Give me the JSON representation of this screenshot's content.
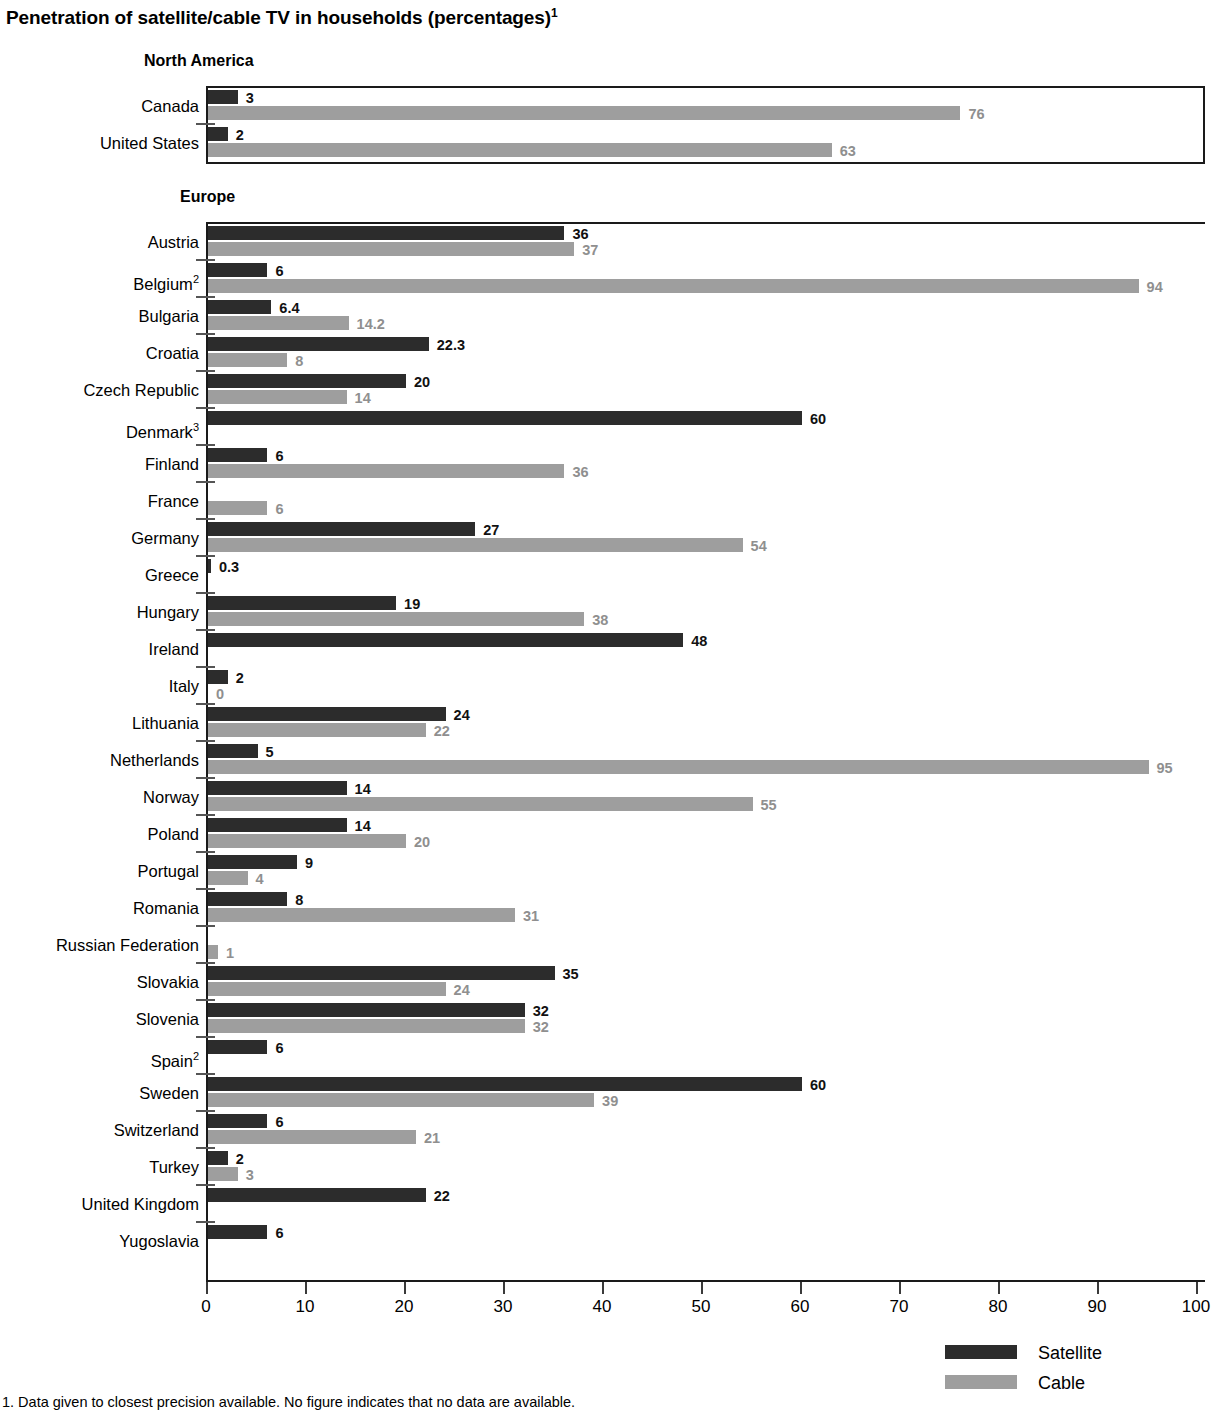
{
  "title": {
    "text": "Penetration of satellite/cable TV in households (percentages)",
    "footnote_marker": "1"
  },
  "legend": {
    "items": [
      {
        "label": "Satellite",
        "color": "#2c2c2c",
        "key": "satellite"
      },
      {
        "label": "Cable",
        "color": "#9e9e9e",
        "key": "cable"
      }
    ]
  },
  "axis": {
    "ticks": [
      "0",
      "10",
      "20",
      "30",
      "40",
      "50",
      "60",
      "70",
      "80",
      "90",
      "100"
    ],
    "min": 0,
    "max": 100
  },
  "footnotes": [
    "1. Data given to closest precision available. No figure indicates that no data are available."
  ],
  "chart_data": {
    "type": "bar",
    "orientation": "horizontal",
    "title": "Penetration of satellite/cable TV in households (percentages)",
    "xlabel": "",
    "ylabel": "",
    "xlim": [
      0,
      100
    ],
    "grid": false,
    "legend_position": "bottom-right",
    "series": [
      {
        "name": "Satellite",
        "color": "#2c2c2c"
      },
      {
        "name": "Cable",
        "color": "#9e9e9e"
      }
    ],
    "groups": [
      {
        "name": "North America",
        "rows": [
          {
            "label": "Canada",
            "satellite": 3,
            "satellite_text": "3",
            "cable": 76,
            "cable_text": "76"
          },
          {
            "label": "United States",
            "satellite": 2,
            "satellite_text": "2",
            "cable": 63,
            "cable_text": "63"
          }
        ]
      },
      {
        "name": "Europe",
        "rows": [
          {
            "label": "Austria",
            "satellite": 36,
            "satellite_text": "36",
            "cable": 37,
            "cable_text": "37"
          },
          {
            "label": "Belgium",
            "sup": "2",
            "satellite": 6,
            "satellite_text": "6",
            "cable": 94,
            "cable_text": "94"
          },
          {
            "label": "Bulgaria",
            "satellite": 6.4,
            "satellite_text": "6.4",
            "cable": 14.2,
            "cable_text": "14.2"
          },
          {
            "label": "Croatia",
            "satellite": 22.3,
            "satellite_text": "22.3",
            "cable": 8,
            "cable_text": "8"
          },
          {
            "label": "Czech Republic",
            "satellite": 20,
            "satellite_text": "20",
            "cable": 14,
            "cable_text": "14"
          },
          {
            "label": "Denmark",
            "sup": "3",
            "satellite": 60,
            "satellite_text": "60",
            "cable": null,
            "cable_text": ""
          },
          {
            "label": "Finland",
            "satellite": 6,
            "satellite_text": "6",
            "cable": 36,
            "cable_text": "36"
          },
          {
            "label": "France",
            "satellite": null,
            "satellite_text": "",
            "cable": 6,
            "cable_text": "6"
          },
          {
            "label": "Germany",
            "satellite": 27,
            "satellite_text": "27",
            "cable": 54,
            "cable_text": "54"
          },
          {
            "label": "Greece",
            "satellite": 0.3,
            "satellite_text": "0.3",
            "cable": null,
            "cable_text": ""
          },
          {
            "label": "Hungary",
            "satellite": 19,
            "satellite_text": "19",
            "cable": 38,
            "cable_text": "38"
          },
          {
            "label": "Ireland",
            "satellite": 48,
            "satellite_text": "48",
            "cable": null,
            "cable_text": ""
          },
          {
            "label": "Italy",
            "satellite": 2,
            "satellite_text": "2",
            "cable": 0,
            "cable_text": "0"
          },
          {
            "label": "Lithuania",
            "satellite": 24,
            "satellite_text": "24",
            "cable": 22,
            "cable_text": "22"
          },
          {
            "label": "Netherlands",
            "satellite": 5,
            "satellite_text": "5",
            "cable": 95,
            "cable_text": "95"
          },
          {
            "label": "Norway",
            "satellite": 14,
            "satellite_text": "14",
            "cable": 55,
            "cable_text": "55"
          },
          {
            "label": "Poland",
            "satellite": 14,
            "satellite_text": "14",
            "cable": 20,
            "cable_text": "20"
          },
          {
            "label": "Portugal",
            "satellite": 9,
            "satellite_text": "9",
            "cable": 4,
            "cable_text": "4"
          },
          {
            "label": "Romania",
            "satellite": 8,
            "satellite_text": "8",
            "cable": 31,
            "cable_text": "31"
          },
          {
            "label": "Russian Federation",
            "satellite": null,
            "satellite_text": "",
            "cable": 1,
            "cable_text": "1"
          },
          {
            "label": "Slovakia",
            "satellite": 35,
            "satellite_text": "35",
            "cable": 24,
            "cable_text": "24"
          },
          {
            "label": "Slovenia",
            "satellite": 32,
            "satellite_text": "32",
            "cable": 32,
            "cable_text": "32"
          },
          {
            "label": "Spain",
            "sup": "2",
            "satellite": 6,
            "satellite_text": "6",
            "cable": null,
            "cable_text": ""
          },
          {
            "label": "Sweden",
            "satellite": 60,
            "satellite_text": "60",
            "cable": 39,
            "cable_text": "39"
          },
          {
            "label": "Switzerland",
            "satellite": 6,
            "satellite_text": "6",
            "cable": 21,
            "cable_text": "21"
          },
          {
            "label": "Turkey",
            "satellite": 2,
            "satellite_text": "2",
            "cable": 3,
            "cable_text": "3"
          },
          {
            "label": "United Kingdom",
            "satellite": 22,
            "satellite_text": "22",
            "cable": null,
            "cable_text": ""
          },
          {
            "label": "Yugoslavia",
            "satellite": 6,
            "satellite_text": "6",
            "cable": null,
            "cable_text": ""
          }
        ]
      }
    ]
  }
}
